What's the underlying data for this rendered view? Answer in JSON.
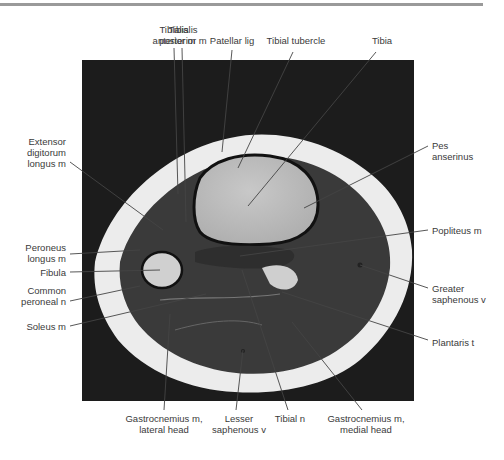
{
  "figure": {
    "image_frame": {
      "x": 82,
      "y": 60,
      "width": 332,
      "height": 341,
      "background": "#1c1c1c"
    },
    "labels": [
      {
        "id": "tibialis-anterior",
        "text": "Tibialis\nanterior m",
        "x": 174,
        "y": 24,
        "align": "c",
        "line": [
          [
            174,
            48
          ],
          [
            178,
            194
          ]
        ]
      },
      {
        "id": "tibialis-posterior",
        "text": "Tibialis\nposterior m",
        "x": 183,
        "y": 24,
        "align": "c",
        "line": [
          [
            182,
            48
          ],
          [
            186,
            222
          ]
        ]
      },
      {
        "id": "patellar-lig",
        "text": "Patellar lig",
        "x": 232,
        "y": 35,
        "align": "c",
        "line": [
          [
            232,
            50
          ],
          [
            222,
            152
          ]
        ]
      },
      {
        "id": "tibial-tubercle",
        "text": "Tibial tubercle",
        "x": 296,
        "y": 35,
        "align": "c",
        "line": [
          [
            293,
            52
          ],
          [
            238,
            168
          ]
        ]
      },
      {
        "id": "tibia",
        "text": "Tibia",
        "x": 382,
        "y": 35,
        "align": "c",
        "line": [
          [
            376,
            52
          ],
          [
            248,
            206
          ]
        ]
      },
      {
        "id": "extensor-digitorum",
        "text": "Extensor\ndigitorum\nlongus m",
        "x": 66,
        "y": 136,
        "align": "r",
        "line": [
          [
            70,
            162
          ],
          [
            163,
            230
          ]
        ]
      },
      {
        "id": "pes-anserinus",
        "text": "Pes\nanserinus",
        "x": 432,
        "y": 140,
        "align": "l",
        "line": [
          [
            428,
            146
          ],
          [
            304,
            208
          ]
        ]
      },
      {
        "id": "popliteus",
        "text": "Popliteus m",
        "x": 432,
        "y": 225,
        "align": "l",
        "line": [
          [
            428,
            230
          ],
          [
            240,
            256
          ]
        ]
      },
      {
        "id": "peroneus-longus",
        "text": "Peroneus\nlongus m",
        "x": 66,
        "y": 242,
        "align": "r",
        "line": [
          [
            70,
            254
          ],
          [
            140,
            250
          ]
        ]
      },
      {
        "id": "fibula",
        "text": "Fibula",
        "x": 66,
        "y": 267,
        "align": "r",
        "line": [
          [
            70,
            272
          ],
          [
            160,
            270
          ]
        ]
      },
      {
        "id": "common-peroneal",
        "text": "Common\nperoneal n",
        "x": 66,
        "y": 285,
        "align": "r",
        "line": [
          [
            70,
            301
          ],
          [
            140,
            286
          ]
        ]
      },
      {
        "id": "greater-saphenous",
        "text": "Greater\nsaphenous v",
        "x": 432,
        "y": 283,
        "align": "l",
        "line": [
          [
            428,
            288
          ],
          [
            360,
            265
          ]
        ]
      },
      {
        "id": "soleus",
        "text": "Soleus m",
        "x": 66,
        "y": 321,
        "align": "r",
        "line": [
          [
            70,
            326
          ],
          [
            206,
            294
          ]
        ]
      },
      {
        "id": "plantaris",
        "text": "Plantaris t",
        "x": 432,
        "y": 337,
        "align": "l",
        "line": [
          [
            428,
            340
          ],
          [
            282,
            292
          ]
        ]
      },
      {
        "id": "gastrocnemius-lateral",
        "text": "Gastrocnemius m,\nlateral head",
        "x": 164,
        "y": 413,
        "align": "c",
        "line": [
          [
            164,
            410
          ],
          [
            170,
            314
          ]
        ]
      },
      {
        "id": "lesser-saphenous",
        "text": "Lesser\nsaphenous v",
        "x": 239,
        "y": 413,
        "align": "c",
        "line": [
          [
            236,
            410
          ],
          [
            243,
            350
          ]
        ]
      },
      {
        "id": "tibial-n",
        "text": "Tibial n",
        "x": 290,
        "y": 413,
        "align": "c",
        "line": [
          [
            288,
            410
          ],
          [
            242,
            270
          ]
        ]
      },
      {
        "id": "gastrocnemius-medial",
        "text": "Gastrocnemius m,\nmedial head",
        "x": 366,
        "y": 413,
        "align": "c",
        "line": [
          [
            362,
            410
          ],
          [
            292,
            322
          ]
        ]
      }
    ]
  }
}
